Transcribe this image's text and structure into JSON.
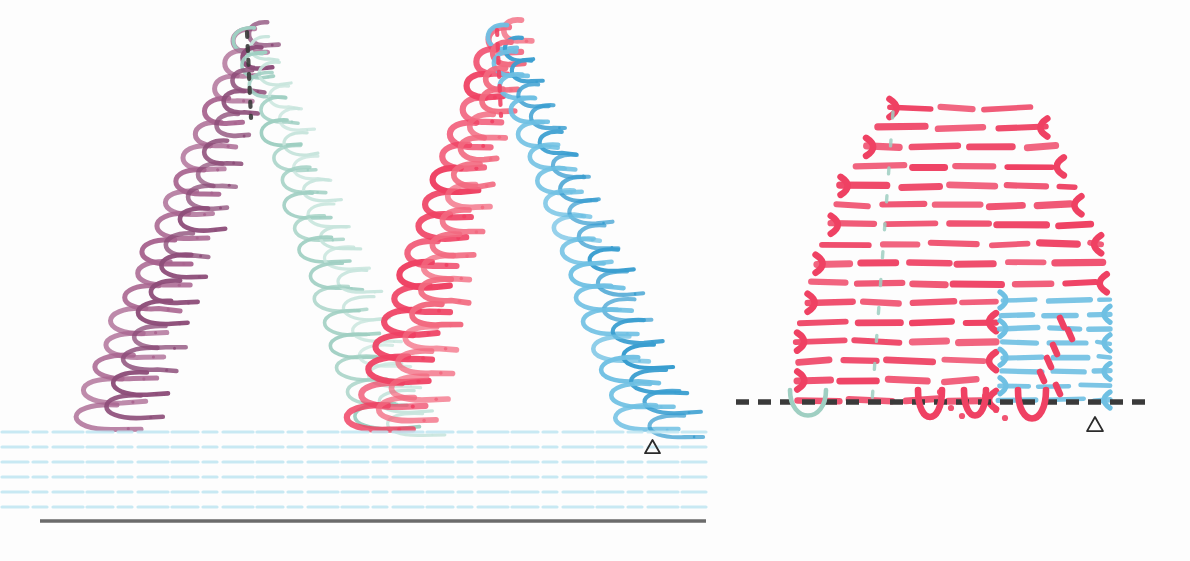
{
  "figure": {
    "background_color": "#fdfdfd",
    "width": 1190,
    "height": 561,
    "panels": [
      {
        "id": "left-panel",
        "name": "twin-peak-coil-panel",
        "x": 0,
        "y": 0,
        "w": 710,
        "h": 561
      },
      {
        "id": "right-panel",
        "name": "serpentine-dome-panel",
        "x": 730,
        "y": 0,
        "w": 460,
        "h": 561
      }
    ]
  },
  "colors": {
    "red": "#ef4163",
    "red_light": "#f2697f",
    "blue": "#6fc0e3",
    "blue_deep": "#3a9ed0",
    "purple": "#a8648f",
    "purple_deep": "#8d4d79",
    "teal": "#9fcfc2",
    "teal_pale": "#c8e5dd",
    "baseline_blue": "#bfe6f2",
    "dark_rule": "#6b6b6b",
    "dash_dark": "#3a3a3a",
    "marker_outline": "#2b2b2b"
  },
  "left_panel": {
    "name": "twin-peak-coil-panel",
    "peaks": [
      {
        "name": "peak-one",
        "apex_x": 247,
        "apex_y": 40,
        "base_y": 415,
        "left_color": "purple",
        "right_color": "teal",
        "left_base_x": 95,
        "right_base_x": 375,
        "coil_count": 17,
        "apex_marker": "dashed-dark-vertical"
      },
      {
        "name": "peak-two",
        "apex_x": 497,
        "apex_y": 38,
        "base_y": 418,
        "left_color": "red",
        "right_color": "blue",
        "left_base_x": 372,
        "right_base_x": 640,
        "coil_count": 17,
        "apex_marker": "dashed-red-vertical"
      }
    ],
    "baseline_lines": {
      "name": "horizontal-guide-lines",
      "count": 6,
      "color": "baseline_blue",
      "y_values": [
        432,
        447,
        462,
        477,
        492,
        507
      ],
      "x_start": 2,
      "x_end": 706
    },
    "bottom_rule": {
      "name": "solid-bottom-rule",
      "y": 521,
      "x_start": 40,
      "x_end": 706,
      "color": "dark_rule"
    },
    "triangle_marker": {
      "name": "triangle-marker-left",
      "x": 645,
      "y": 440,
      "size": 15
    }
  },
  "right_panel": {
    "name": "serpentine-dome-panel",
    "dome": {
      "name": "red-serpentine-dome",
      "color": "red",
      "rows": 16,
      "row_height": 18.5,
      "top_y": 108,
      "bottom_y": 400,
      "center_x": 960,
      "max_half_width": 160
    },
    "blue_block": {
      "name": "blue-serpentine-block",
      "color": "blue",
      "rows": 8,
      "top_y": 300,
      "bottom_y": 400,
      "x_start": 1000,
      "x_end": 1110
    },
    "red_dash_overlay": {
      "name": "red-dash-overlay",
      "color": "red",
      "points": [
        [
          1060,
          318
        ],
        [
          1068,
          330
        ],
        [
          1053,
          345
        ],
        [
          1047,
          358
        ],
        [
          1040,
          372
        ],
        [
          1056,
          385
        ]
      ]
    },
    "center_dashes": {
      "name": "green-center-dashed-line",
      "color": "teal",
      "x_top": 893,
      "x_bottom": 872,
      "y_top": 112,
      "y_bottom": 402
    },
    "baseline_dashed": {
      "name": "dashed-baseline",
      "y": 402,
      "x_start": 736,
      "x_end": 1152,
      "color": "dash_dark",
      "dash": "13 9"
    },
    "below_baseline": [
      {
        "name": "green-dip-arc",
        "color": "teal",
        "cx": 808,
        "cy": 402,
        "rx": 18,
        "ry": 22
      },
      {
        "name": "red-dip-hook-1",
        "color": "red",
        "cx": 930,
        "cy": 402,
        "rx": 12,
        "ry": 24
      },
      {
        "name": "red-dip-hook-2",
        "color": "red",
        "cx": 975,
        "cy": 402,
        "rx": 11,
        "ry": 22
      },
      {
        "name": "red-dip-hook-3",
        "color": "red",
        "cx": 1032,
        "cy": 402,
        "rx": 14,
        "ry": 26
      }
    ],
    "triangle_marker": {
      "name": "triangle-marker-right",
      "x": 1087,
      "y": 417,
      "size": 16
    }
  }
}
